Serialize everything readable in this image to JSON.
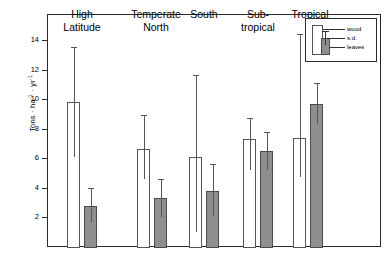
{
  "chart_data": {
    "type": "bar",
    "title": "",
    "xlabel": "",
    "ylabel": "Tons · ha⁻¹ · yr⁻¹",
    "ylabel_parts": {
      "lead": "Tons · ha",
      "exp1": "-1",
      "mid": " · yr",
      "exp2": "-1"
    },
    "ylim": [
      0,
      15.3
    ],
    "yticks": [
      2,
      4,
      6,
      8,
      10,
      12,
      14
    ],
    "ytick_labels": [
      "2",
      "4",
      "6",
      "8",
      "10",
      "12",
      "14"
    ],
    "grid": false,
    "legend_position": "top-right",
    "categories": [
      "High Latitude",
      "Temperate North",
      "Temperate South",
      "Sub-tropical",
      "Tropical"
    ],
    "category_label_lines": [
      [
        "High",
        "Latitude"
      ],
      [
        "Temperate",
        "North"
      ],
      [
        "",
        "South"
      ],
      [
        "Sub-",
        "tropical"
      ],
      [
        "",
        "Tropical"
      ]
    ],
    "series": [
      {
        "name": "wood",
        "color": "#ffffff",
        "edge_color": "#555555",
        "values": [
          9.8,
          6.6,
          6.1,
          7.3,
          7.4
        ],
        "sd_upper": [
          13.5,
          8.9,
          11.6,
          8.7,
          14.4
        ],
        "sd_lower": [
          6.1,
          4.6,
          1.0,
          5.2,
          4.7
        ]
      },
      {
        "name": "leaves",
        "color": "#8f8f8f",
        "edge_color": "#4a4a4a",
        "values": [
          2.8,
          3.3,
          3.8,
          6.5,
          9.7
        ],
        "sd_upper": [
          4.0,
          4.6,
          5.6,
          7.8,
          11.1
        ],
        "sd_lower": [
          1.7,
          2.0,
          2.1,
          5.2,
          8.3
        ]
      }
    ],
    "legend_entries": [
      "wood",
      "s.d.",
      "leaves"
    ]
  }
}
